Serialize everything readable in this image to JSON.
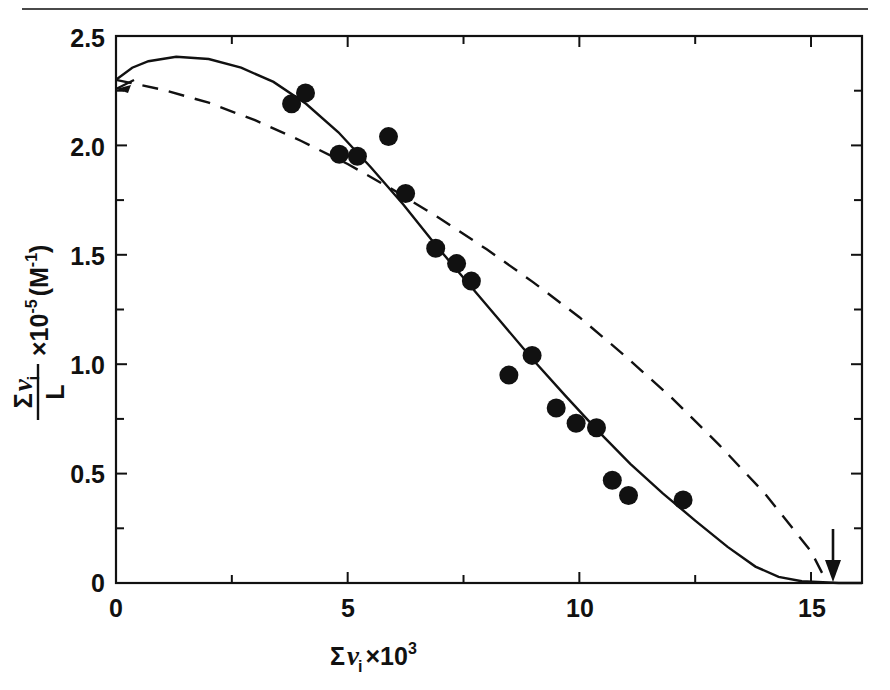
{
  "figure": {
    "top_rule": "horizontal-rule",
    "background_color": "#ffffff",
    "line_color": "#111111"
  },
  "axes": {
    "x_tick_labels": [
      "0",
      "5",
      "10",
      "15"
    ],
    "y_tick_labels": [
      "0",
      "0.5",
      "1.0",
      "1.5",
      "2.0",
      "2.5"
    ],
    "x_title_sigma": "Σ",
    "x_title_nu": "ν",
    "x_title_sub": "i",
    "x_title_times": "×10",
    "x_title_exp": "3",
    "y_title_sigma": "Σ",
    "y_title_nu": "ν",
    "y_title_sub": "i",
    "y_title_denom": "L",
    "y_title_times": "×10",
    "y_title_exp": "-5",
    "y_title_units": "(M",
    "y_title_units_exp": "-1",
    "y_title_units_close": ")"
  },
  "annotations": {
    "arrow_marker": "down-arrow-marker",
    "arrow_x": 15.4
  },
  "chart_data": {
    "type": "scatter",
    "title": "",
    "xlabel": "Σνᵢ × 10³",
    "ylabel": "(Σνᵢ)/L × 10⁻⁵ (M⁻¹)",
    "xlim": [
      0,
      16.1
    ],
    "ylim": [
      0,
      2.5
    ],
    "x_major_ticks": [
      0,
      5,
      10,
      15
    ],
    "x_minor_ticks": [
      2.5,
      7.5,
      12.5
    ],
    "y_major_ticks": [
      0,
      0.5,
      1.0,
      1.5,
      2.0,
      2.5
    ],
    "y_minor_ticks": [
      0.25,
      0.75,
      1.25,
      1.75,
      2.25
    ],
    "grid": false,
    "legend": null,
    "points": [
      {
        "x": 3.79,
        "y": 2.19
      },
      {
        "x": 4.09,
        "y": 2.24
      },
      {
        "x": 4.82,
        "y": 1.96
      },
      {
        "x": 5.21,
        "y": 1.95
      },
      {
        "x": 5.88,
        "y": 2.04
      },
      {
        "x": 6.25,
        "y": 1.78
      },
      {
        "x": 6.9,
        "y": 1.53
      },
      {
        "x": 7.35,
        "y": 1.46
      },
      {
        "x": 7.67,
        "y": 1.38
      },
      {
        "x": 8.48,
        "y": 0.95
      },
      {
        "x": 8.98,
        "y": 1.04
      },
      {
        "x": 9.5,
        "y": 0.8
      },
      {
        "x": 9.93,
        "y": 0.73
      },
      {
        "x": 10.37,
        "y": 0.71
      },
      {
        "x": 10.71,
        "y": 0.47
      },
      {
        "x": 11.06,
        "y": 0.4
      },
      {
        "x": 12.24,
        "y": 0.38
      }
    ],
    "series": [
      {
        "name": "solid-curve",
        "style": "solid",
        "points": [
          [
            0.0,
            2.3
          ],
          [
            0.35,
            2.355
          ],
          [
            0.7,
            2.385
          ],
          [
            1.3,
            2.405
          ],
          [
            2.0,
            2.395
          ],
          [
            2.7,
            2.355
          ],
          [
            3.4,
            2.29
          ],
          [
            4.1,
            2.19
          ],
          [
            4.8,
            2.06
          ],
          [
            5.5,
            1.9
          ],
          [
            6.2,
            1.73
          ],
          [
            6.9,
            1.545
          ],
          [
            7.6,
            1.37
          ],
          [
            8.3,
            1.195
          ],
          [
            9.0,
            1.02
          ],
          [
            9.7,
            0.855
          ],
          [
            10.4,
            0.695
          ],
          [
            11.1,
            0.545
          ],
          [
            11.8,
            0.41
          ],
          [
            12.5,
            0.285
          ],
          [
            13.2,
            0.165
          ],
          [
            13.8,
            0.075
          ],
          [
            14.3,
            0.028
          ],
          [
            14.8,
            0.008
          ],
          [
            15.6,
            0.0
          ],
          [
            16.1,
            0.0
          ]
        ]
      },
      {
        "name": "dashed-line",
        "style": "dashed",
        "points": [
          [
            0.0,
            2.3
          ],
          [
            1.0,
            2.255
          ],
          [
            2.0,
            2.195
          ],
          [
            3.0,
            2.115
          ],
          [
            4.0,
            2.02
          ],
          [
            5.0,
            1.915
          ],
          [
            6.0,
            1.795
          ],
          [
            7.0,
            1.665
          ],
          [
            8.0,
            1.525
          ],
          [
            9.0,
            1.375
          ],
          [
            10.0,
            1.215
          ],
          [
            11.0,
            1.035
          ],
          [
            12.0,
            0.845
          ],
          [
            13.0,
            0.635
          ],
          [
            14.0,
            0.41
          ],
          [
            15.0,
            0.145
          ],
          [
            15.35,
            0.0
          ]
        ]
      }
    ]
  }
}
